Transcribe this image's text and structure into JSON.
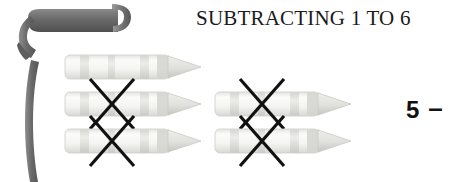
{
  "page": {
    "width": 464,
    "height": 182,
    "background": "#ffffff"
  },
  "header": {
    "title": "SUBTRACTING 1 TO 6"
  },
  "decoration": {
    "ribbon_name": "dark-gray-curled-ribbon",
    "ribbon_color": "#6d6d6d",
    "ribbon_shadow_color": "#4a4a4a"
  },
  "counters": {
    "object_name": "crayon",
    "object_body_color": "#f2f2f0",
    "object_band_color": "#dcdcda",
    "object_tip_color": "#e7e7e4",
    "object_outline_color": "#c9c9c5",
    "cross_color": "#111111",
    "total": 5,
    "crossed_out": 4,
    "remaining": 1,
    "rows": [
      {
        "row": 1,
        "items": [
          {
            "index": 1,
            "crossed": false,
            "x": 64,
            "y": 52
          }
        ]
      },
      {
        "row": 2,
        "items": [
          {
            "index": 2,
            "crossed": true,
            "x": 64,
            "y": 89
          },
          {
            "index": 3,
            "crossed": true,
            "x": 214,
            "y": 89
          }
        ]
      },
      {
        "row": 3,
        "items": [
          {
            "index": 4,
            "crossed": true,
            "x": 64,
            "y": 126
          },
          {
            "index": 5,
            "crossed": true,
            "x": 214,
            "y": 126
          }
        ]
      }
    ]
  },
  "equation": {
    "first_operand": "5",
    "operator": "–"
  }
}
